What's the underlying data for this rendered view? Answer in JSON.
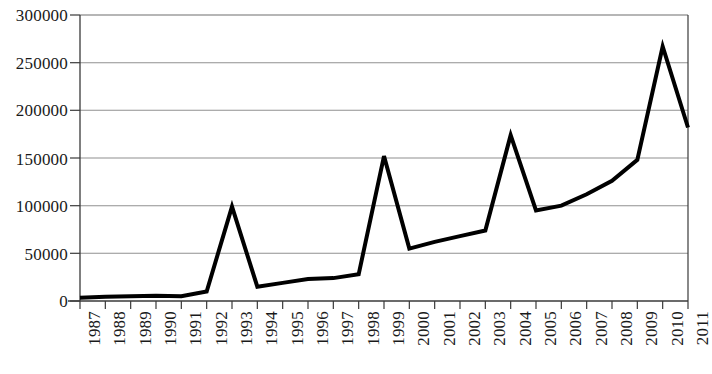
{
  "chart_data": {
    "type": "line",
    "title": "",
    "xlabel": "",
    "ylabel": "",
    "categories": [
      "1987",
      "1988",
      "1989",
      "1990",
      "1991",
      "1992",
      "1993",
      "1994",
      "1995",
      "1996",
      "1997",
      "1998",
      "1999",
      "2000",
      "2001",
      "2002",
      "2003",
      "2004",
      "2005",
      "2006",
      "2007",
      "2008",
      "2009",
      "2010",
      "2011"
    ],
    "values": [
      3500,
      4500,
      5000,
      5500,
      5000,
      10000,
      99000,
      15000,
      19000,
      23000,
      24000,
      28000,
      152000,
      55000,
      62000,
      68000,
      74000,
      174000,
      95000,
      100000,
      112000,
      126000,
      148000,
      267000,
      182000
    ],
    "series": [
      {
        "name": "series-1",
        "color": "#000000",
        "values": [
          3500,
          4500,
          5000,
          5500,
          5000,
          10000,
          99000,
          15000,
          19000,
          23000,
          24000,
          28000,
          152000,
          55000,
          62000,
          68000,
          74000,
          174000,
          95000,
          100000,
          112000,
          126000,
          148000,
          267000,
          182000
        ]
      }
    ],
    "ylim": [
      0,
      300000
    ],
    "y_ticks": [
      0,
      50000,
      100000,
      150000,
      200000,
      250000,
      300000
    ],
    "y_tick_labels": [
      "0",
      "50000",
      "100000",
      "150000",
      "200000",
      "250000",
      "300000"
    ],
    "grid": true,
    "grid_axis": "y",
    "grid_color": "#808080",
    "legend": "none",
    "x_tick_label_rotation": 90,
    "line_color": "#000000",
    "line_width": 4,
    "background_color": "#ffffff"
  }
}
